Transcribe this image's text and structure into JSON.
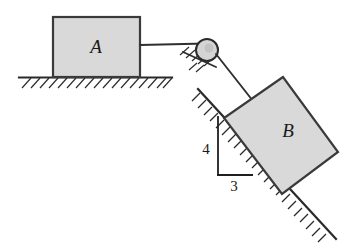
{
  "figure": {
    "background_color": "#ffffff",
    "block_fill_color": "#d9d9d9",
    "line_color": "#2a2a2a"
  },
  "labels": {
    "block_a": "A",
    "block_b": "B",
    "rise": "4",
    "run": "3"
  },
  "elements": {
    "block_a_name": "block-a",
    "block_b_name": "block-b",
    "ground_name": "horizontal-ground-surface",
    "incline_name": "inclined-surface",
    "pulley_name": "pulley",
    "cord_name": "connecting-cord",
    "triangle_name": "slope-ratio-triangle"
  },
  "geometry": {
    "block_a": {
      "x": 53,
      "y": 17,
      "width": 87,
      "height": 60
    },
    "ground": {
      "x1": 19,
      "y1": 77,
      "x2": 172,
      "y2": 77
    },
    "pulley": {
      "cx": 207,
      "cy": 50,
      "r": 11
    },
    "cord_horizontal": {
      "x1": 140,
      "y1": 45,
      "x2": 205,
      "y2": 44
    },
    "cord_to_block": {
      "x1": 216,
      "y1": 54,
      "x2": 252,
      "y2": 100
    },
    "block_b_points": "283,77 224,118 282,194 338,152",
    "incline": {
      "x1": 198,
      "y1": 90,
      "x2": 336,
      "y2": 239
    },
    "triangle_vertical": {
      "x": 218,
      "y1": 117,
      "y2": 175
    },
    "triangle_horizontal": {
      "y": 175,
      "x1": 218,
      "x2": 253
    },
    "slope_ratio": {
      "rise": 4,
      "run": 3
    }
  }
}
